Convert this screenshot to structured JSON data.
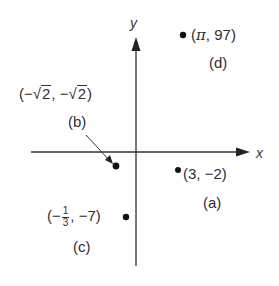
{
  "diagram": {
    "type": "coordinate-plane-points",
    "axes": {
      "x_label": "x",
      "y_label": "y"
    },
    "points": [
      {
        "id": "a",
        "tag": "(a)",
        "coord_text": "(3, −2)",
        "x": "3",
        "y": "−2"
      },
      {
        "id": "b",
        "tag": "(b)",
        "coord_prefix": "(−",
        "coord_sqrt1": "2",
        "coord_mid": ", −",
        "coord_sqrt2": "2",
        "coord_suffix": ")",
        "x": "−√2",
        "y": "−√2"
      },
      {
        "id": "c",
        "tag": "(c)",
        "coord_prefix": "(−",
        "frac_num": "1",
        "frac_den": "3",
        "coord_suffix": ", −7)",
        "x": "−1/3",
        "y": "−7"
      },
      {
        "id": "d",
        "tag": "(d)",
        "coord_prefix": "(",
        "pi": "π",
        "coord_suffix": ", 97)",
        "x": "π",
        "y": "97"
      }
    ],
    "colors": {
      "ink": "#2f2f2f",
      "background": "#ffffff"
    }
  }
}
